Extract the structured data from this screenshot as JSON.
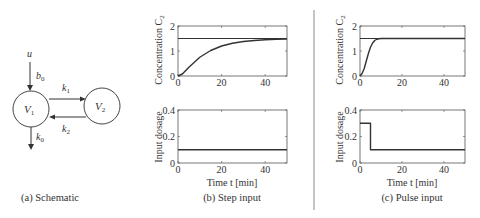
{
  "schematic": {
    "caption": "(a) Schematic",
    "input_label": "u",
    "input_gain": "b",
    "input_gain_sub": "0",
    "compartment1": "V",
    "compartment1_sub": "1",
    "compartment2": "V",
    "compartment2_sub": "2",
    "k1": "k",
    "k1_sub": "1",
    "k2": "k",
    "k2_sub": "2",
    "k0": "k",
    "k0_sub": "0"
  },
  "panels": {
    "step": {
      "caption": "(b) Step input"
    },
    "pulse": {
      "caption": "(c) Pulse input"
    }
  },
  "labels": {
    "conc_ylabel": "Concentration C",
    "conc_ylabel_sub": "2",
    "dose_ylabel": "Input dosage",
    "xlabel": "Time t [min]"
  },
  "colors": {
    "line": "#333333",
    "axes": "#555555"
  },
  "chart_data": [
    {
      "type": "line",
      "panel": "(b) Step input - concentration",
      "xlabel": "",
      "ylabel": "Concentration C2",
      "xlim": [
        0,
        50
      ],
      "ylim": [
        0,
        2
      ],
      "xticks": [
        0,
        20,
        40
      ],
      "yticks": [
        0,
        1,
        2
      ],
      "series": [
        {
          "name": "C2 response",
          "x": [
            0,
            2,
            5,
            10,
            15,
            20,
            25,
            30,
            35,
            40,
            45,
            50
          ],
          "y": [
            0,
            0.08,
            0.35,
            0.75,
            1.02,
            1.2,
            1.31,
            1.38,
            1.42,
            1.45,
            1.47,
            1.48
          ]
        },
        {
          "name": "reference",
          "x": [
            0,
            50
          ],
          "y": [
            1.5,
            1.5
          ]
        }
      ]
    },
    {
      "type": "line",
      "panel": "(b) Step input - dosage",
      "xlabel": "Time t [min]",
      "ylabel": "Input dosage",
      "xlim": [
        0,
        50
      ],
      "ylim": [
        0,
        0.4
      ],
      "xticks": [
        0,
        20,
        40
      ],
      "yticks": [
        0,
        0.2,
        0.4
      ],
      "series": [
        {
          "name": "u",
          "x": [
            0,
            50
          ],
          "y": [
            0.1,
            0.1
          ]
        }
      ]
    },
    {
      "type": "line",
      "panel": "(c) Pulse input - concentration",
      "xlabel": "",
      "ylabel": "Concentration C2",
      "xlim": [
        0,
        50
      ],
      "ylim": [
        0,
        2
      ],
      "xticks": [
        0,
        20,
        40
      ],
      "yticks": [
        0,
        1,
        2
      ],
      "series": [
        {
          "name": "C2 response",
          "x": [
            0,
            1,
            2,
            3,
            4,
            5,
            6,
            7,
            8,
            9,
            10,
            12,
            50
          ],
          "y": [
            0,
            0.1,
            0.3,
            0.6,
            0.9,
            1.15,
            1.32,
            1.42,
            1.47,
            1.49,
            1.5,
            1.5,
            1.5
          ]
        },
        {
          "name": "reference",
          "x": [
            0,
            50
          ],
          "y": [
            1.5,
            1.5
          ]
        }
      ]
    },
    {
      "type": "line",
      "panel": "(c) Pulse input - dosage",
      "xlabel": "Time t [min]",
      "ylabel": "Input dosage",
      "xlim": [
        0,
        50
      ],
      "ylim": [
        0,
        0.4
      ],
      "xticks": [
        0,
        20,
        40
      ],
      "yticks": [
        0,
        0.2,
        0.4
      ],
      "series": [
        {
          "name": "u",
          "x": [
            0,
            5,
            5,
            50
          ],
          "y": [
            0.3,
            0.3,
            0.1,
            0.1
          ]
        }
      ]
    }
  ]
}
